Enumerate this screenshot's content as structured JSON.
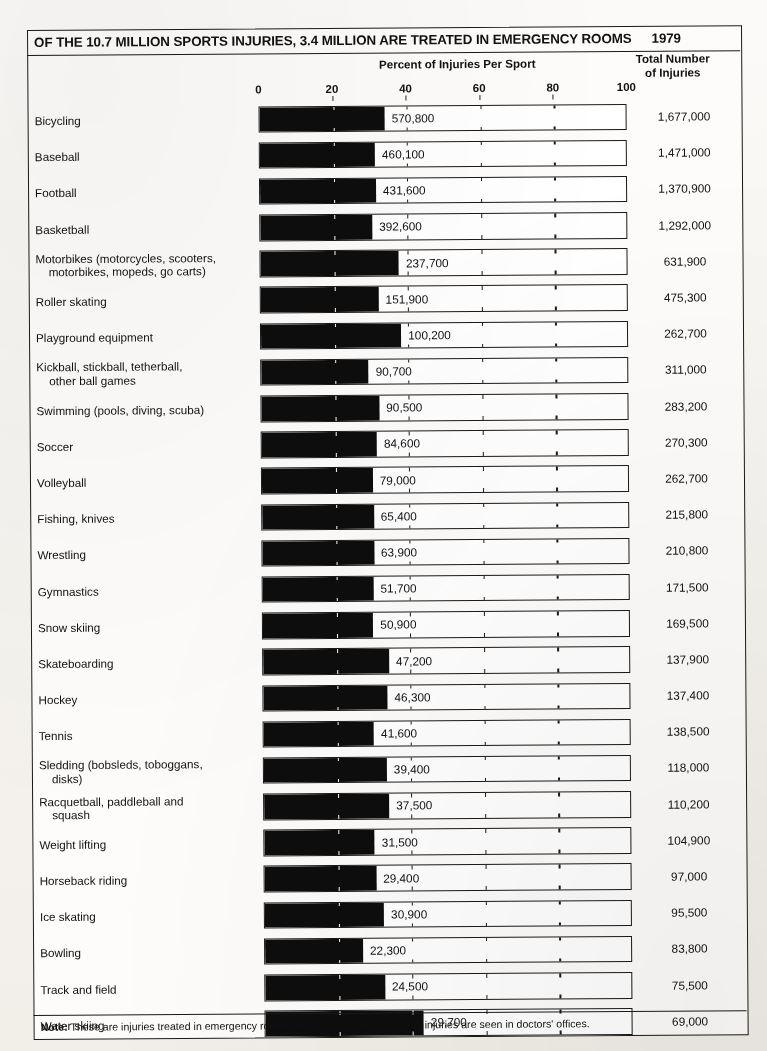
{
  "header": {
    "title": "OF THE 10.7 MILLION SPORTS INJURIES,  3.4 MILLION ARE TREATED IN EMERGENCY ROOMS",
    "year": "1979",
    "axis_title": "Percent of Injuries Per Sport",
    "right_column_header_line1": "Total Number",
    "right_column_header_line2": "of Injuries"
  },
  "note": {
    "label": "Note:",
    "text": " These are injuries treated in emergency rooms only.  At least twice as many injuries are seen in doctors' offices."
  },
  "chart_data": {
    "type": "bar",
    "title": "OF THE 10.7 MILLION SPORTS INJURIES,  3.4 MILLION ARE TREATED IN EMERGENCY ROOMS",
    "subtitle": "1979",
    "xlabel": "Percent of Injuries Per Sport",
    "ylabel": "",
    "xlim": [
      0,
      100
    ],
    "xticks": [
      0,
      20,
      40,
      60,
      80,
      100
    ],
    "xticklabels": [
      "0",
      "20",
      "40",
      "60",
      "80",
      "100"
    ],
    "grid": false,
    "legend": null,
    "orientation": "horizontal",
    "value_unit": "percent",
    "categories": [
      "Bicycling",
      "Baseball",
      "Football",
      "Basketball",
      "Motorbikes (motorcycles, scooters, motorbikes, mopeds, go carts)",
      "Roller skating",
      "Playground equipment",
      "Kickball, stickball, tetherball, other ball games",
      "Swimming (pools, diving, scuba)",
      "Soccer",
      "Volleyball",
      "Fishing, knives",
      "Wrestling",
      "Gymnastics",
      "Snow skiing",
      "Skateboarding",
      "Hockey",
      "Tennis",
      "Sledding (bobsleds, toboggans, disks)",
      "Racquetball, paddleball and squash",
      "Weight lifting",
      "Horseback riding",
      "Ice skating",
      "Bowling",
      "Track and field",
      "Water skiing"
    ],
    "series": [
      {
        "name": "Percent of injuries per sport treated in emergency rooms",
        "values": [
          34.0,
          31.3,
          31.5,
          30.4,
          37.6,
          32.0,
          38.1,
          29.2,
          32.0,
          31.3,
          30.1,
          30.3,
          30.3,
          30.1,
          30.0,
          34.2,
          33.7,
          30.0,
          33.4,
          34.0,
          30.0,
          30.3,
          32.4,
          26.6,
          32.5,
          43.0
        ]
      }
    ],
    "emergency_room_injuries": [
      570800,
      460100,
      431600,
      392600,
      237700,
      151900,
      100200,
      90700,
      90500,
      84600,
      79000,
      65400,
      63900,
      51700,
      50900,
      47200,
      46300,
      41600,
      39400,
      37500,
      31500,
      29400,
      30900,
      22300,
      24500,
      29700
    ],
    "total_injuries": [
      1677000,
      1471000,
      1370900,
      1292000,
      631900,
      475300,
      262700,
      311000,
      283200,
      270300,
      262700,
      215800,
      210800,
      171500,
      169500,
      137900,
      137400,
      138500,
      118000,
      110200,
      104900,
      97000,
      95500,
      83800,
      75500,
      69000
    ]
  },
  "rows": [
    {
      "label": "Bicycling",
      "label2": "",
      "value": "570,800",
      "total": "1,677,000",
      "pct": 34.0
    },
    {
      "label": "Baseball",
      "label2": "",
      "value": "460,100",
      "total": "1,471,000",
      "pct": 31.3
    },
    {
      "label": "Football",
      "label2": "",
      "value": "431,600",
      "total": "1,370,900",
      "pct": 31.5
    },
    {
      "label": "Basketball",
      "label2": "",
      "value": "392,600",
      "total": "1,292,000",
      "pct": 30.4
    },
    {
      "label": "Motorbikes (motorcycles, scooters,",
      "label2": "motorbikes, mopeds, go carts)",
      "value": "237,700",
      "total": "631,900",
      "pct": 37.6
    },
    {
      "label": "Roller skating",
      "label2": "",
      "value": "151,900",
      "total": "475,300",
      "pct": 32.0
    },
    {
      "label": "Playground equipment",
      "label2": "",
      "value": "100,200",
      "total": "262,700",
      "pct": 38.1
    },
    {
      "label": "Kickball, stickball, tetherball,",
      "label2": "other ball games",
      "value": "90,700",
      "total": "311,000",
      "pct": 29.2
    },
    {
      "label": "Swimming (pools, diving, scuba)",
      "label2": "",
      "value": "90,500",
      "total": "283,200",
      "pct": 32.0
    },
    {
      "label": "Soccer",
      "label2": "",
      "value": "84,600",
      "total": "270,300",
      "pct": 31.3
    },
    {
      "label": "Volleyball",
      "label2": "",
      "value": "79,000",
      "total": "262,700",
      "pct": 30.1
    },
    {
      "label": "Fishing, knives",
      "label2": "",
      "value": "65,400",
      "total": "215,800",
      "pct": 30.3
    },
    {
      "label": "Wrestling",
      "label2": "",
      "value": "63,900",
      "total": "210,800",
      "pct": 30.3
    },
    {
      "label": "Gymnastics",
      "label2": "",
      "value": "51,700",
      "total": "171,500",
      "pct": 30.1
    },
    {
      "label": "Snow skiing",
      "label2": "",
      "value": "50,900",
      "total": "169,500",
      "pct": 30.0
    },
    {
      "label": "Skateboarding",
      "label2": "",
      "value": "47,200",
      "total": "137,900",
      "pct": 34.2
    },
    {
      "label": "Hockey",
      "label2": "",
      "value": "46,300",
      "total": "137,400",
      "pct": 33.7
    },
    {
      "label": "Tennis",
      "label2": "",
      "value": "41,600",
      "total": "138,500",
      "pct": 30.0
    },
    {
      "label": "Sledding (bobsleds, toboggans,",
      "label2": "disks)",
      "value": "39,400",
      "total": "118,000",
      "pct": 33.4
    },
    {
      "label": "Racquetball, paddleball and",
      "label2": "squash",
      "value": "37,500",
      "total": "110,200",
      "pct": 34.0
    },
    {
      "label": "Weight lifting",
      "label2": "",
      "value": "31,500",
      "total": "104,900",
      "pct": 30.0
    },
    {
      "label": "Horseback riding",
      "label2": "",
      "value": "29,400",
      "total": "97,000",
      "pct": 30.3
    },
    {
      "label": "Ice skating",
      "label2": "",
      "value": "30,900",
      "total": "95,500",
      "pct": 32.4
    },
    {
      "label": "Bowling",
      "label2": "",
      "value": "22,300",
      "total": "83,800",
      "pct": 26.6
    },
    {
      "label": "Track and field",
      "label2": "",
      "value": "24,500",
      "total": "75,500",
      "pct": 32.5
    },
    {
      "label": "Water skiing",
      "label2": "",
      "value": "29,700",
      "total": "69,000",
      "pct": 43.0
    }
  ]
}
